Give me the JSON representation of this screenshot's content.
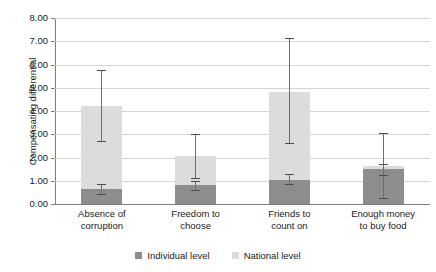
{
  "chart_data": {
    "type": "bar",
    "title": "",
    "subtitle": "",
    "xlabel": "",
    "ylabel": "Compensating differential",
    "ylim": [
      0,
      8
    ],
    "ytick_step": 1,
    "ytick_labels": [
      "8.00",
      "7.00",
      "6.00",
      "5.00",
      "4.00",
      "3.00",
      "2.00",
      "1.00",
      "0.00"
    ],
    "grid": true,
    "stacked": true,
    "legend_position": "bottom-center",
    "categories": [
      "Absence of corruption",
      "Freedom to choose",
      "Friends to count on",
      "Enough money to buy food"
    ],
    "category_lines": [
      [
        "Absence of",
        "corruption"
      ],
      [
        "Freedom to",
        "choose"
      ],
      [
        "Friends to",
        "count on"
      ],
      [
        "Enough money",
        "to buy food"
      ]
    ],
    "series": [
      {
        "name": "Individual level",
        "color": "#8d8d8d",
        "values": [
          0.65,
          0.8,
          1.05,
          1.5
        ],
        "error_low": [
          0.45,
          0.62,
          0.85,
          1.25
        ],
        "error_high": [
          0.85,
          0.97,
          1.28,
          1.72
        ]
      },
      {
        "name": "National level",
        "color": "#dcdcdc",
        "values": [
          3.55,
          1.25,
          3.75,
          0.15
        ],
        "totals": [
          4.2,
          2.05,
          4.8,
          1.65
        ],
        "error_low": [
          2.73,
          1.1,
          2.62,
          0.25
        ],
        "error_high": [
          5.78,
          3.02,
          7.15,
          3.05
        ]
      }
    ],
    "legend": [
      {
        "label": "Individual level",
        "color": "#8d8d8d"
      },
      {
        "label": "National level",
        "color": "#dcdcdc"
      }
    ]
  },
  "figure": {
    "cropped_header_text": ""
  }
}
